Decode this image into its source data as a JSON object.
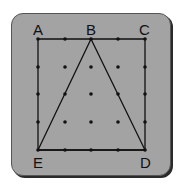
{
  "diagram": {
    "type": "geoboard",
    "grid": {
      "columns": 5,
      "rows": 5,
      "x": [
        38,
        65,
        91,
        118,
        145
      ],
      "y": [
        39,
        67,
        94,
        122,
        150
      ]
    },
    "square": {
      "vertices": [
        "A",
        "C",
        "D",
        "E"
      ]
    },
    "triangle": {
      "vertices": [
        "B",
        "D",
        "E"
      ]
    },
    "labels": {
      "A": "A",
      "B": "B",
      "C": "C",
      "D": "D",
      "E": "E"
    },
    "colors": {
      "board": "#a3a3a3",
      "ink": "#111111"
    }
  }
}
